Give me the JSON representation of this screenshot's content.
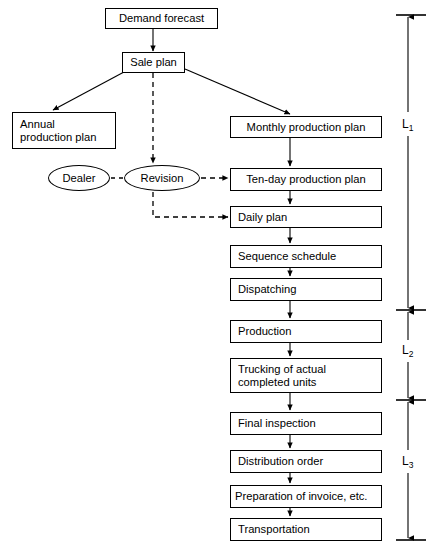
{
  "diagram": {
    "line_color": "#000000",
    "background_color": "#ffffff",
    "nodes": [
      {
        "id": "demand_forecast",
        "label": "Demand forecast",
        "shape": "rect",
        "align": "center",
        "x": 105,
        "y": 8,
        "w": 113,
        "h": 21
      },
      {
        "id": "sale_plan",
        "label": "Sale plan",
        "shape": "rect",
        "align": "center",
        "x": 122,
        "y": 52,
        "w": 63,
        "h": 21
      },
      {
        "id": "annual_plan",
        "label": "Annual\nproduction plan",
        "shape": "rect",
        "align": "left",
        "x": 12,
        "y": 112,
        "w": 104,
        "h": 37
      },
      {
        "id": "monthly_plan",
        "label": "Monthly production plan",
        "shape": "rect",
        "align": "center",
        "x": 230,
        "y": 116,
        "w": 152,
        "h": 22
      },
      {
        "id": "dealer",
        "label": "Dealer",
        "shape": "ellipse",
        "align": "center",
        "x": 48,
        "y": 165,
        "w": 62,
        "h": 26
      },
      {
        "id": "revision",
        "label": "Revision",
        "shape": "ellipse",
        "align": "center",
        "x": 124,
        "y": 165,
        "w": 76,
        "h": 26
      },
      {
        "id": "ten_day_plan",
        "label": "Ten-day production plan",
        "shape": "rect",
        "align": "center",
        "x": 230,
        "y": 168,
        "w": 152,
        "h": 23
      },
      {
        "id": "daily_plan",
        "label": "Daily plan",
        "shape": "rect",
        "align": "left",
        "x": 230,
        "y": 206,
        "w": 152,
        "h": 22
      },
      {
        "id": "sequence_schedule",
        "label": "Sequence schedule",
        "shape": "rect",
        "align": "left",
        "x": 230,
        "y": 245,
        "w": 152,
        "h": 23
      },
      {
        "id": "dispatching",
        "label": "Dispatching",
        "shape": "rect",
        "align": "left",
        "x": 230,
        "y": 278,
        "w": 152,
        "h": 23
      },
      {
        "id": "production",
        "label": "Production",
        "shape": "rect",
        "align": "left",
        "x": 230,
        "y": 320,
        "w": 152,
        "h": 23
      },
      {
        "id": "trucking",
        "label": "Trucking of actual\ncompleted units",
        "shape": "rect",
        "align": "left",
        "x": 230,
        "y": 358,
        "w": 152,
        "h": 35
      },
      {
        "id": "final_inspection",
        "label": "Final inspection",
        "shape": "rect",
        "align": "left",
        "x": 230,
        "y": 412,
        "w": 152,
        "h": 23
      },
      {
        "id": "distribution_order",
        "label": "Distribution order",
        "shape": "rect",
        "align": "left",
        "x": 230,
        "y": 450,
        "w": 152,
        "h": 23
      },
      {
        "id": "preparation",
        "label": "Preparation of invoice, etc.",
        "shape": "rect",
        "align": "left",
        "x": 230,
        "y": 485,
        "w": 152,
        "h": 23
      },
      {
        "id": "transportation",
        "label": "Transportation",
        "shape": "rect",
        "align": "left",
        "x": 230,
        "y": 518,
        "w": 152,
        "h": 23
      }
    ],
    "edges": [
      {
        "from": "demand_forecast",
        "to": "sale_plan",
        "style": "solid",
        "arrow": true
      },
      {
        "from": "sale_plan",
        "to": "annual_plan",
        "style": "solid",
        "arrow": true
      },
      {
        "from": "sale_plan",
        "to": "monthly_plan",
        "style": "solid",
        "arrow": true
      },
      {
        "from": "sale_plan",
        "to": "revision",
        "style": "dashed",
        "arrow": true
      },
      {
        "from": "monthly_plan",
        "to": "ten_day_plan",
        "style": "solid",
        "arrow": true
      },
      {
        "from": "dealer",
        "to": "revision",
        "style": "dashed",
        "arrow": false
      },
      {
        "from": "revision",
        "to": "ten_day_plan",
        "style": "dashed",
        "arrow": true
      },
      {
        "from": "revision",
        "to": "daily_plan",
        "style": "dashed",
        "arrow": true
      },
      {
        "from": "ten_day_plan",
        "to": "daily_plan",
        "style": "solid",
        "arrow": true
      },
      {
        "from": "daily_plan",
        "to": "sequence_schedule",
        "style": "solid",
        "arrow": true
      },
      {
        "from": "sequence_schedule",
        "to": "dispatching",
        "style": "solid",
        "arrow": true
      },
      {
        "from": "dispatching",
        "to": "production",
        "style": "solid",
        "arrow": true
      },
      {
        "from": "production",
        "to": "trucking",
        "style": "solid",
        "arrow": true
      },
      {
        "from": "trucking",
        "to": "final_inspection",
        "style": "solid",
        "arrow": true
      },
      {
        "from": "final_inspection",
        "to": "distribution_order",
        "style": "solid",
        "arrow": true
      },
      {
        "from": "distribution_order",
        "to": "preparation",
        "style": "solid",
        "arrow": true
      },
      {
        "from": "preparation",
        "to": "transportation",
        "style": "solid",
        "arrow": true
      }
    ],
    "dimensions": [
      {
        "id": "L1",
        "label": "L",
        "subscript": "1",
        "x": 408,
        "top": 15,
        "bottom": 310,
        "label_y": 124
      },
      {
        "id": "L2",
        "label": "L",
        "subscript": "2",
        "x": 408,
        "top": 310,
        "bottom": 400,
        "label_y": 350
      },
      {
        "id": "L3",
        "label": "L",
        "subscript": "3",
        "x": 408,
        "top": 400,
        "bottom": 540,
        "label_y": 461
      }
    ]
  }
}
